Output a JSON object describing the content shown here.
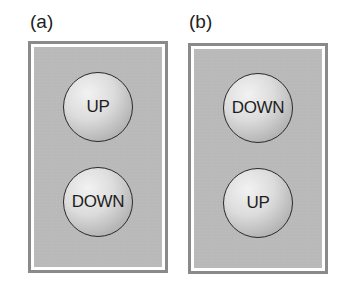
{
  "panels": [
    {
      "label": "(a)",
      "buttons": [
        {
          "label": "UP"
        },
        {
          "label": "DOWN"
        }
      ]
    },
    {
      "label": "(b)",
      "buttons": [
        {
          "label": "DOWN"
        },
        {
          "label": "UP"
        }
      ]
    }
  ],
  "colors": {
    "frame_border": "#8a8a8a",
    "panel_fill": "#b9b9b9",
    "button_outline": "#2a2a2a"
  }
}
